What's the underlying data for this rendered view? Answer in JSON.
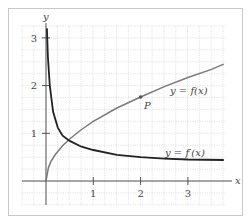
{
  "chart_data": {
    "type": "line",
    "title": "",
    "xlabel": "x",
    "ylabel": "y",
    "xlim": [
      -0.5,
      3.8
    ],
    "ylim": [
      -0.5,
      3.25
    ],
    "grid": true,
    "grid_step": 0.25,
    "x_ticks": [
      "1",
      "2",
      "3"
    ],
    "y_ticks": [
      "1",
      "2",
      "3"
    ],
    "series": [
      {
        "name": "y = f(x)",
        "color": "#777777",
        "x": [
          0,
          0.05,
          0.1,
          0.2,
          0.35,
          0.5,
          0.75,
          1,
          1.5,
          2,
          2.5,
          3,
          3.5,
          3.76
        ],
        "y": [
          0,
          0.28,
          0.4,
          0.56,
          0.74,
          0.88,
          1.08,
          1.25,
          1.53,
          1.76,
          1.98,
          2.17,
          2.34,
          2.45
        ]
      },
      {
        "name": "y = f'(x)",
        "color": "#222222",
        "x": [
          0.02,
          0.04,
          0.08,
          0.15,
          0.25,
          0.35,
          0.5,
          0.75,
          1,
          1.5,
          2,
          2.5,
          3,
          3.76
        ],
        "y": [
          3.2,
          2.6,
          2.0,
          1.45,
          1.12,
          0.95,
          0.84,
          0.72,
          0.65,
          0.55,
          0.5,
          0.47,
          0.45,
          0.44
        ]
      }
    ],
    "annotations": [
      {
        "label": "P",
        "x": 2,
        "y": 1.76,
        "marker": "point on f(x)"
      },
      {
        "label": "y = f(x)",
        "x": 3.2,
        "y": 1.55
      },
      {
        "label": "y = f'(x)",
        "x": 3.2,
        "y": 0.55
      }
    ]
  },
  "labels": {
    "x_axis": "x",
    "y_axis": "y",
    "tick_x1": "1",
    "tick_x2": "2",
    "tick_x3": "3",
    "tick_y1": "1",
    "tick_y2": "2",
    "tick_y3": "3",
    "point_p": "P",
    "f_label": "y = f(x)",
    "fprime_label": "y = f′(x)"
  }
}
